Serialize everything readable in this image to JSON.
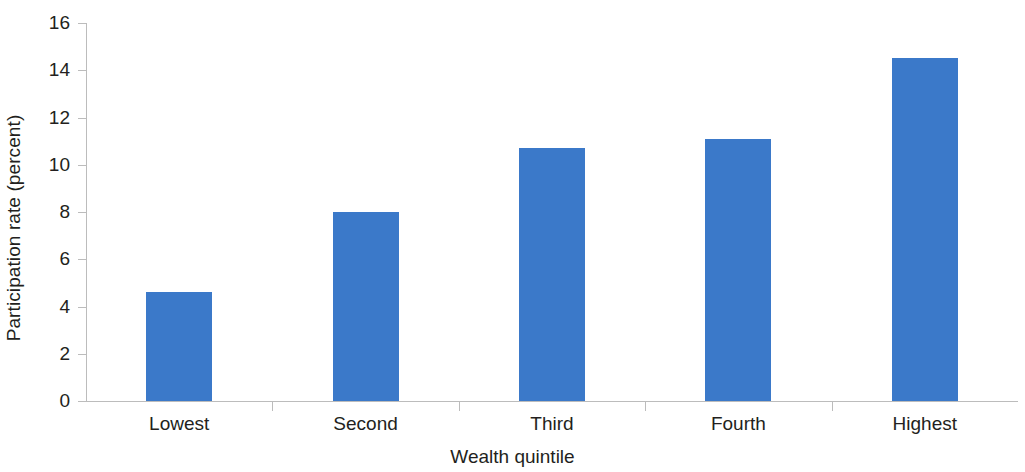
{
  "chart_data": {
    "type": "bar",
    "title": "",
    "subtitle": "",
    "xlabel": "Wealth quintile",
    "ylabel": "Participation rate (percent)",
    "categories": [
      "Lowest",
      "Second",
      "Third",
      "Fourth",
      "Highest"
    ],
    "values": [
      4.6,
      8.0,
      10.7,
      11.1,
      14.5
    ],
    "series": [
      {
        "name": "Participation rate",
        "values": [
          4.6,
          8.0,
          10.7,
          11.1,
          14.5
        ]
      }
    ],
    "ylim": [
      0,
      16
    ],
    "ytick_values": [
      0,
      2,
      4,
      6,
      8,
      10,
      12,
      14,
      16
    ],
    "ytick_labels": [
      "0",
      "2",
      "4",
      "6",
      "8",
      "10",
      "12",
      "14",
      "16"
    ],
    "grid": false,
    "legend": false,
    "legend_position": "none",
    "bar_color": "#3b79c9",
    "axis_color": "#bcbcbc",
    "text_color": "#231f20",
    "background_color": "#ffffff"
  }
}
